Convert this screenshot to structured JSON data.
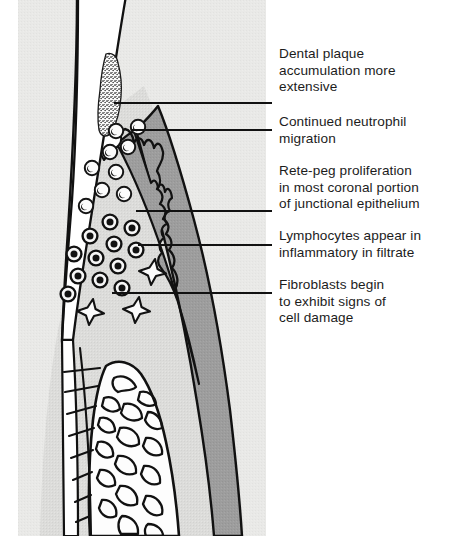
{
  "figure": {
    "background_color": "#ffffff",
    "panel_background_color": "#e8e8e6",
    "gingiva_color": "#9a9a9a",
    "connective_tissue_color": "#d8d8d6",
    "tooth_color": "#ffffff",
    "outline_color": "#111111",
    "text_color": "#1c1c1c"
  },
  "callouts": [
    {
      "id": "dental-plaque",
      "text": "Dental plaque\naccumulation more\nextensive",
      "leader_y": 103,
      "leader_x_start": 114,
      "leader_x_end": 272
    },
    {
      "id": "continued-neutrophil-migration",
      "text": "Continued neutrophil\nmigration",
      "leader_y": 130,
      "leader_x_start": 132,
      "leader_x_end": 272
    },
    {
      "id": "rete-peg-proliferation",
      "text": "Rete-peg proliferation\nin most coronal portion\nof junctional epithelium",
      "leader_y": 211,
      "leader_x_start": 136,
      "leader_x_end": 272
    },
    {
      "id": "lymphocytes-infiltrate",
      "text": "Lymphocytes appear in\ninflammatory in filtrate",
      "leader_y": 245,
      "leader_x_start": 138,
      "leader_x_end": 272
    },
    {
      "id": "fibroblast-cell-damage",
      "text": "Fibroblasts begin\nto exhibit signs of\ncell damage",
      "leader_y": 293,
      "leader_x_start": 112,
      "leader_x_end": 272
    }
  ],
  "anatomy": {
    "structures": [
      {
        "name": "tooth-enamel-dentin",
        "label": "Tooth (enamel / dentin)"
      },
      {
        "name": "dental-plaque-deposit",
        "label": "Dental plaque deposit"
      },
      {
        "name": "gingival-epithelium",
        "label": "Gingival epithelium"
      },
      {
        "name": "junctional-epithelium-rete-pegs",
        "label": "Junctional epithelium with rete pegs"
      },
      {
        "name": "connective-tissue",
        "label": "Connective tissue"
      },
      {
        "name": "alveolar-bone",
        "label": "Alveolar bone with trabeculae"
      },
      {
        "name": "periodontal-ligament",
        "label": "Periodontal ligament fibers"
      }
    ],
    "cells": [
      {
        "name": "neutrophil",
        "label": "Neutrophil",
        "count": 9,
        "style": "light circle with lobed nucleus"
      },
      {
        "name": "lymphocyte",
        "label": "Lymphocyte",
        "count": 12,
        "style": "dark filled circle with ring"
      },
      {
        "name": "fibroblast",
        "label": "Fibroblast",
        "count": 3,
        "style": "four-pointed spindle star"
      }
    ]
  }
}
